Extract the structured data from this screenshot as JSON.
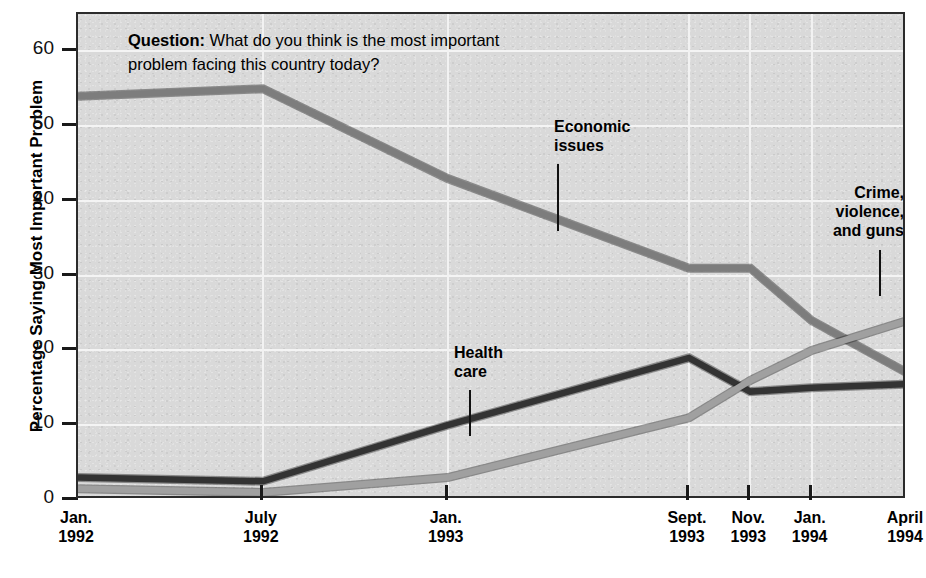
{
  "chart_data": {
    "type": "line",
    "title": "",
    "question": {
      "label": "Question:",
      "text": " What do you think is the most important problem facing this country today?"
    },
    "xlabel": "",
    "ylabel": "Percentage Saying Most Important Problem",
    "ylim": [
      0,
      65
    ],
    "yticks": [
      0,
      10,
      20,
      30,
      40,
      50,
      60
    ],
    "ytick_labels": [
      "0",
      "10",
      "20",
      "30",
      "40",
      "50",
      "60"
    ],
    "grid": true,
    "legend_position": "inline-annotations",
    "categories": [
      "Jan. 1992",
      "July 1992",
      "Jan. 1993",
      "Sept. 1993",
      "Nov. 1993",
      "Jan. 1994",
      "April 1994"
    ],
    "xtick_labels": [
      {
        "month": "Jan.",
        "year": "1992"
      },
      {
        "month": "July",
        "year": "1992"
      },
      {
        "month": "Jan.",
        "year": "1993"
      },
      {
        "month": "Sept.",
        "year": "1993"
      },
      {
        "month": "Nov.",
        "year": "1993"
      },
      {
        "month": "Jan.",
        "year": "1994"
      },
      {
        "month": "April",
        "year": "1994"
      }
    ],
    "xtick_positions_pct": [
      0,
      22.3,
      44.6,
      73.7,
      81.1,
      88.5,
      100
    ],
    "series": [
      {
        "name": "Economic issues",
        "color": "#7d7d7d",
        "values": [
          54,
          55,
          43,
          31,
          31,
          24,
          17
        ]
      },
      {
        "name": "Health care",
        "color": "#333333",
        "values": [
          3,
          2.5,
          10,
          19,
          14.5,
          15,
          15.5
        ]
      },
      {
        "name": "Crime, violence, and guns",
        "color": "#a0a0a0",
        "values": [
          1.5,
          1,
          3,
          11,
          16,
          20,
          24
        ]
      }
    ],
    "annotations": [
      {
        "id": "economic",
        "text": "Economic\nissues",
        "line1": "Economic",
        "line2": "issues"
      },
      {
        "id": "health",
        "text": "Health\ncare",
        "line1": "Health",
        "line2": "care"
      },
      {
        "id": "crime",
        "text": "Crime, violence, and guns",
        "line1": "Crime,",
        "line2": "violence,",
        "line3": "and guns"
      }
    ],
    "colors": {
      "plot_background": "#d9d9d9",
      "frame": "#2b2b2b",
      "gridline": "#f3f3f3",
      "text": "#000000"
    }
  }
}
